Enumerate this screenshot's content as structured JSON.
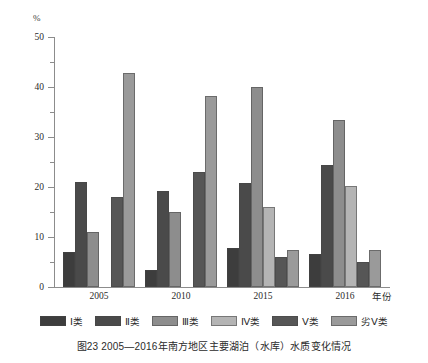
{
  "chart_data": {
    "type": "bar",
    "title": "",
    "xlabel": "年份",
    "ylabel": "%",
    "ylim": [
      0,
      50
    ],
    "yticks": [
      0,
      10,
      20,
      30,
      40,
      50
    ],
    "ytick_labels": [
      "0",
      "10",
      "20",
      "30",
      "40",
      "50"
    ],
    "minor_yticks": [
      5,
      15,
      25,
      35,
      45
    ],
    "grid": false,
    "legend_position": "bottom",
    "categories": [
      "2005",
      "2010",
      "2015",
      "2016"
    ],
    "series": [
      {
        "name": "Ⅰ类",
        "color": "#3d3d3d",
        "values": [
          7.0,
          3.5,
          7.8,
          6.7
        ]
      },
      {
        "name": "Ⅱ类",
        "color": "#4a4a4a",
        "values": [
          21.0,
          19.2,
          20.8,
          24.5
        ]
      },
      {
        "name": "Ⅲ类",
        "color": "#8d8d8d",
        "values": [
          11.0,
          15.0,
          40.0,
          33.4
        ]
      },
      {
        "name": "Ⅳ类",
        "color": "#b4b4b4",
        "values": [
          0.0,
          0.0,
          16.0,
          20.3
        ]
      },
      {
        "name": "Ⅴ类",
        "color": "#565656",
        "values": [
          18.0,
          23.0,
          6.0,
          5.0
        ]
      },
      {
        "name": "劣Ⅴ类",
        "color": "#9a9a9a",
        "values": [
          42.8,
          38.2,
          7.5,
          7.5
        ]
      }
    ]
  },
  "axis": {
    "unit_label": "%",
    "x_title": "年份"
  },
  "legend": {
    "items": [
      {
        "label": "Ⅰ类",
        "color": "#3d3d3d"
      },
      {
        "label": "Ⅱ类",
        "color": "#4a4a4a"
      },
      {
        "label": "Ⅲ类",
        "color": "#8d8d8d"
      },
      {
        "label": "Ⅳ类",
        "color": "#b4b4b4"
      },
      {
        "label": "Ⅴ类",
        "color": "#565656"
      },
      {
        "label": "劣Ⅴ类",
        "color": "#9a9a9a"
      }
    ]
  },
  "caption": {
    "text": "图23  2005—2016年南方地区主要湖泊（水库）水质变化情况"
  }
}
